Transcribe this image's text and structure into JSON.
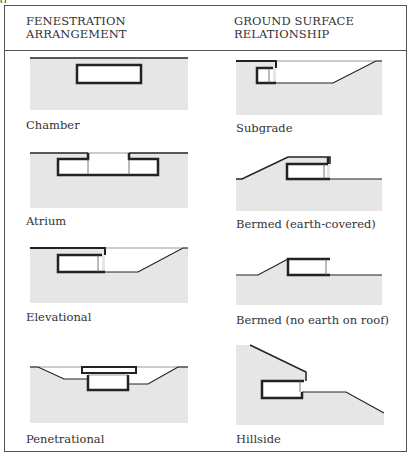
{
  "headers": {
    "left": [
      "FENESTRATION",
      "ARRANGEMENT"
    ],
    "right": [
      "GROUND SURFACE",
      "RELATIONSHIP"
    ]
  },
  "left_column": [
    {
      "label": "Chamber"
    },
    {
      "label": "Atrium"
    },
    {
      "label": "Elevational"
    },
    {
      "label": "Penetrational"
    }
  ],
  "right_column": [
    {
      "label": "Subgrade"
    },
    {
      "label": "Bermed (earth-covered)"
    },
    {
      "label": "Bermed (no earth on roof)"
    },
    {
      "label": "Hillside"
    }
  ],
  "colors": {
    "earth": "#e6e6e6",
    "line": "#222222",
    "border": "#555555"
  }
}
